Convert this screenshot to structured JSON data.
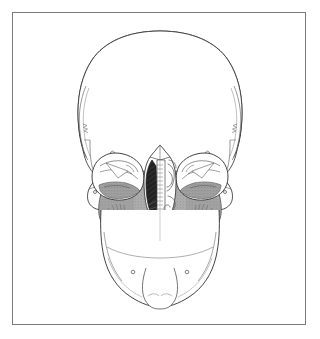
{
  "figure": {
    "title": "Human skull, anterior (frontal) view",
    "subject": "skull",
    "view": "anterior",
    "style": "ink line drawing with tonal shading",
    "frame": {
      "present": true,
      "border_color": "#7a7a7a",
      "border_width_px": 1,
      "background_color": "#ffffff",
      "left_px": 12,
      "top_px": 12,
      "width_px": 294,
      "height_px": 313
    },
    "palette": {
      "outline": "#3a3a3a",
      "fine_line": "#6b6b6b",
      "paper": "#ffffff",
      "shaded_bone": "#a9a9a9",
      "shaded_bone_dark": "#8f8f8f",
      "dark_recess": "#1e1e1e",
      "tooth_fill": "#ffffff"
    },
    "regions": [
      {
        "name": "calvaria",
        "label": "Cranial vault (frontal bone)",
        "shading": "unshaded"
      },
      {
        "name": "temporal-line-left",
        "label": "Left temporal line",
        "shading": "line-only"
      },
      {
        "name": "temporal-line-right",
        "label": "Right temporal line",
        "shading": "line-only"
      },
      {
        "name": "orbit-left",
        "label": "Left orbit",
        "shading": "partial"
      },
      {
        "name": "orbit-right",
        "label": "Right orbit",
        "shading": "partial"
      },
      {
        "name": "zygomatic-left",
        "label": "Left zygomatic bone",
        "shading": "unshaded"
      },
      {
        "name": "zygomatic-right",
        "label": "Right zygomatic bone",
        "shading": "unshaded"
      },
      {
        "name": "maxilla",
        "label": "Maxilla / midface",
        "shading": "gray stipple"
      },
      {
        "name": "nasal-cavity-left",
        "label": "Left nasal cavity",
        "shading": "dark"
      },
      {
        "name": "nasal-septum",
        "label": "Nasal septum / vomer",
        "shading": "light"
      },
      {
        "name": "turbinates-right",
        "label": "Right nasal conchae (turbinates)",
        "shading": "line scroll"
      },
      {
        "name": "maxillary-teeth",
        "label": "Upper dental arch",
        "count": 16
      },
      {
        "name": "mandibular-teeth",
        "label": "Lower dental arch",
        "count": 16
      },
      {
        "name": "mandible",
        "label": "Mandible",
        "shading": "unshaded"
      },
      {
        "name": "mental-protuberance",
        "label": "Mental protuberance (chin)",
        "shading": "line-only"
      }
    ],
    "landmarks": [
      {
        "name": "infraorbital-foramen-left",
        "label": "Infraorbital foramen (left)"
      },
      {
        "name": "infraorbital-foramen-right",
        "label": "Infraorbital foramen (right)"
      },
      {
        "name": "zygomaticofacial-foramen-left",
        "label": "Zygomaticofacial foramen (left)"
      },
      {
        "name": "zygomaticofacial-foramen-right",
        "label": "Zygomaticofacial foramen (right)"
      },
      {
        "name": "mental-foramen-left",
        "label": "Mental foramen (left)"
      },
      {
        "name": "mental-foramen-right",
        "label": "Mental foramen (right)"
      },
      {
        "name": "anterior-nasal-spine",
        "label": "Anterior nasal spine"
      },
      {
        "name": "nasion",
        "label": "Nasion"
      }
    ]
  }
}
